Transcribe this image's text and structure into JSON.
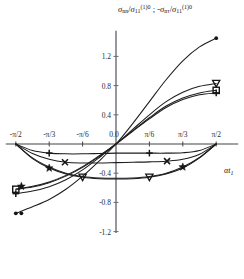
{
  "chart_data": {
    "type": "line",
    "title": "σnn/σ11(1)0 ; -σnτ/σ11(1)0",
    "title_parts": {
      "s1_num": "σ",
      "s1_num_sub": "nn",
      "s1_den": "σ",
      "s1_den_sub": "11",
      "s1_den_sup": "(1)0",
      "sep": " ; ",
      "minus": "-",
      "s2_num": "σ",
      "s2_num_sub": "nτ",
      "s2_den": "σ",
      "s2_den_sub": "11",
      "s2_den_sup": "(1)0",
      "slash": "/"
    },
    "xlabel": "αt",
    "xlabel_sub": "1",
    "ylabel": "",
    "xlim": [
      -1.5707963,
      1.5707963
    ],
    "ylim": [
      -1.2,
      1.55
    ],
    "grid": false,
    "legend": "none",
    "xticks": [
      {
        "value": -1.5707963,
        "label": "-π/2"
      },
      {
        "value": -1.0471976,
        "label": "-π/3"
      },
      {
        "value": -0.5235988,
        "label": "-π/6"
      },
      {
        "value": 0.0,
        "label": "0.0"
      },
      {
        "value": 0.5235988,
        "label": "π/6"
      },
      {
        "value": 1.0471976,
        "label": "π/3"
      },
      {
        "value": 1.5707963,
        "label": "π/2"
      }
    ],
    "yticks": [
      {
        "value": 1.2,
        "label": "1.2"
      },
      {
        "value": 0.8,
        "label": "0.8"
      },
      {
        "value": 0.4,
        "label": "0.4"
      },
      {
        "value": 0.0,
        "label": "0.0"
      },
      {
        "value": -0.4,
        "label": "-0.4"
      },
      {
        "value": -0.8,
        "label": "-0.8"
      },
      {
        "value": -1.2,
        "label": "-1.2"
      }
    ],
    "series": [
      {
        "name": "rising-steepest",
        "marker": "dot",
        "x": [
          -1.5708,
          -1.309,
          -1.0472,
          -0.7854,
          -0.5236,
          -0.2618,
          0.0,
          0.2618,
          0.5236,
          0.7854,
          1.0472,
          1.309,
          1.5708
        ],
        "y": [
          -0.95,
          -0.86,
          -0.76,
          -0.62,
          -0.44,
          -0.23,
          0.0,
          0.28,
          0.58,
          0.88,
          1.14,
          1.33,
          1.45
        ],
        "points": [
          {
            "x": 1.5708,
            "y": 1.45,
            "marker": "dot"
          },
          {
            "x": -1.5708,
            "y": -0.95,
            "marker": "dot"
          }
        ]
      },
      {
        "name": "rising-triangle",
        "marker": "triangle-down",
        "x": [
          -1.5708,
          -1.309,
          -1.0472,
          -0.7854,
          -0.5236,
          -0.2618,
          0.0,
          0.2618,
          0.5236,
          0.7854,
          1.0472,
          1.309,
          1.5708
        ],
        "y": [
          -0.62,
          -0.58,
          -0.52,
          -0.43,
          -0.31,
          -0.16,
          0.0,
          0.2,
          0.4,
          0.58,
          0.71,
          0.79,
          0.83
        ],
        "points": [
          {
            "x": 1.5708,
            "y": 0.83,
            "marker": "triangle-down"
          }
        ]
      },
      {
        "name": "rising-square",
        "marker": "square",
        "x": [
          -1.5708,
          -1.309,
          -1.0472,
          -0.7854,
          -0.5236,
          -0.2618,
          0.0,
          0.2618,
          0.5236,
          0.7854,
          1.0472,
          1.309,
          1.5708
        ],
        "y": [
          -0.62,
          -0.59,
          -0.53,
          -0.44,
          -0.32,
          -0.17,
          0.0,
          0.18,
          0.36,
          0.52,
          0.63,
          0.7,
          0.735
        ],
        "points": [
          {
            "x": 1.5708,
            "y": 0.735,
            "marker": "square"
          },
          {
            "x": -1.5708,
            "y": -0.62,
            "marker": "square"
          }
        ]
      },
      {
        "name": "rising-plus",
        "marker": "plus",
        "x": [
          -1.5708,
          -1.309,
          -1.0472,
          -0.7854,
          -0.5236,
          -0.2618,
          0.0,
          0.2618,
          0.5236,
          0.7854,
          1.0472,
          1.309,
          1.5708
        ],
        "y": [
          -0.68,
          -0.645,
          -0.585,
          -0.49,
          -0.355,
          -0.185,
          0.0,
          0.175,
          0.345,
          0.5,
          0.61,
          0.675,
          0.7
        ],
        "points": [
          {
            "x": 1.5708,
            "y": 0.7,
            "marker": "plus"
          },
          {
            "x": -1.5708,
            "y": -0.68,
            "marker": "plus"
          }
        ]
      },
      {
        "name": "dip-shallow-plus",
        "marker": "plus",
        "x": [
          -1.5708,
          -1.309,
          -1.0472,
          -0.7854,
          -0.5236,
          -0.2618,
          0.0,
          0.2618,
          0.5236,
          0.7854,
          1.0472,
          1.309,
          1.5708
        ],
        "y": [
          0.0,
          -0.09,
          -0.125,
          -0.135,
          -0.135,
          -0.13,
          -0.125,
          -0.125,
          -0.125,
          -0.125,
          -0.12,
          -0.09,
          0.0
        ],
        "points": [
          {
            "x": -1.0472,
            "y": -0.125,
            "marker": "plus"
          },
          {
            "x": 0.5236,
            "y": -0.125,
            "marker": "plus"
          }
        ]
      },
      {
        "name": "dip-mid-cross",
        "marker": "cross",
        "x": [
          -1.5708,
          -1.309,
          -1.0472,
          -0.7854,
          -0.5236,
          -0.2618,
          0.0,
          0.2618,
          0.5236,
          0.7854,
          1.0472,
          1.309,
          1.5708
        ],
        "y": [
          0.0,
          -0.13,
          -0.21,
          -0.25,
          -0.26,
          -0.26,
          -0.255,
          -0.25,
          -0.245,
          -0.235,
          -0.21,
          -0.14,
          0.0
        ],
        "points": [
          {
            "x": -0.8,
            "y": -0.25,
            "marker": "cross"
          },
          {
            "x": 0.8,
            "y": -0.235,
            "marker": "cross"
          }
        ]
      },
      {
        "name": "dip-deep-triangle",
        "marker": "triangle-down",
        "x": [
          -1.5708,
          -1.309,
          -1.0472,
          -0.7854,
          -0.5236,
          -0.2618,
          0.0,
          0.2618,
          0.5236,
          0.7854,
          1.0472,
          1.309,
          1.5708
        ],
        "y": [
          0.0,
          -0.2,
          -0.33,
          -0.41,
          -0.455,
          -0.475,
          -0.48,
          -0.475,
          -0.455,
          -0.41,
          -0.33,
          -0.19,
          0.0
        ],
        "points": [
          {
            "x": -0.5236,
            "y": -0.455,
            "marker": "triangle-down"
          },
          {
            "x": 0.5236,
            "y": -0.455,
            "marker": "triangle-down"
          }
        ]
      },
      {
        "name": "dip-deep-star",
        "marker": "star",
        "x": [
          -1.5708,
          -1.309,
          -1.0472,
          -0.7854,
          -0.5236,
          -0.2618,
          0.0,
          0.2618,
          0.5236,
          0.7854,
          1.0472,
          1.309,
          1.5708
        ],
        "y": [
          0.0,
          -0.19,
          -0.315,
          -0.4,
          -0.445,
          -0.465,
          -0.47,
          -0.465,
          -0.445,
          -0.4,
          -0.315,
          -0.185,
          0.0
        ],
        "points": [
          {
            "x": -1.0472,
            "y": -0.33,
            "marker": "star"
          },
          {
            "x": 1.0472,
            "y": -0.315,
            "marker": "star"
          }
        ]
      }
    ],
    "extra_markers": [
      {
        "x": -1.4835,
        "y": -0.58,
        "marker": "star"
      },
      {
        "x": -1.4835,
        "y": -0.95,
        "marker": "dot"
      }
    ]
  }
}
